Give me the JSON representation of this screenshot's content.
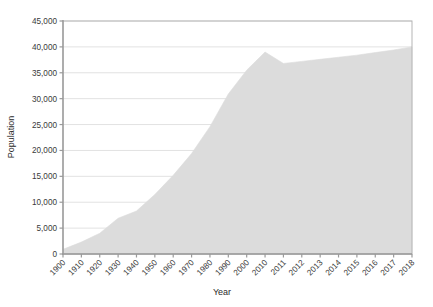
{
  "chart_data": {
    "type": "area",
    "title": "",
    "xlabel": "Year",
    "ylabel": "Population",
    "categories": [
      "1900",
      "1910",
      "1920",
      "1930",
      "1940",
      "1950",
      "1960",
      "1970",
      "1980",
      "1990",
      "2000",
      "2010",
      "2011",
      "2012",
      "2013",
      "2014",
      "2015",
      "2016",
      "2017",
      "2018"
    ],
    "values": [
      900,
      2300,
      4000,
      6900,
      8300,
      11500,
      15200,
      19400,
      24600,
      30900,
      35500,
      39000,
      36800,
      37200,
      37600,
      38000,
      38400,
      38900,
      39400,
      40000
    ],
    "ylim": [
      0,
      45000
    ],
    "yticks": [
      0,
      5000,
      10000,
      15000,
      20000,
      25000,
      30000,
      35000,
      40000,
      45000
    ],
    "ytick_labels": [
      "0",
      "5,000",
      "10,000",
      "15,000",
      "20,000",
      "25,000",
      "30,000",
      "35,000",
      "40,000",
      "45,000"
    ],
    "grid": "horizontal-only",
    "legend": "none",
    "series_name": "Population",
    "colors": {
      "area_fill": "#dcdcdc",
      "grid_line": "#e2e2e2",
      "axis_line": "#9a9a9a",
      "frame_line": "#b5b5b5",
      "tick_text": "#3a3a3a",
      "label_text": "#2b2b2b",
      "background": "#ffffff"
    },
    "xtick_rotation": -45,
    "x_axis_kind": "categorical"
  }
}
